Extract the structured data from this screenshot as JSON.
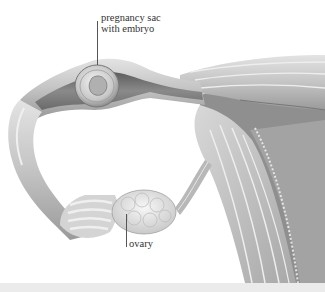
{
  "figure": {
    "labels": [
      {
        "id": "sac",
        "lines": [
          "pregnancy sac",
          "with embryo"
        ]
      },
      {
        "id": "ovary",
        "lines": [
          "ovary"
        ]
      }
    ]
  },
  "colors": {
    "background": "#ffffff",
    "tissue_light": "#d9d9d9",
    "tissue_mid": "#b5b5b5",
    "tissue_dark": "#7a7a7a",
    "label_text": "#333333",
    "bottom_strip": "#ebebeb"
  }
}
